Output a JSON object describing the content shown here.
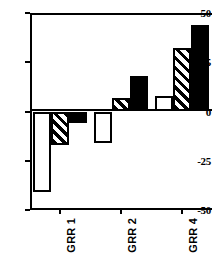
{
  "chart_data": {
    "type": "bar",
    "title": "",
    "subtitle": "",
    "xlabel": "",
    "ylabel": "",
    "categories": [
      "GRR 1",
      "GRR 2",
      "GRR 4"
    ],
    "series": [
      {
        "name": "white",
        "fill": "open",
        "values": [
          -41,
          -16,
          8
        ]
      },
      {
        "name": "hatched",
        "fill": "diagonal-hatch",
        "values": [
          -17,
          7,
          32
        ]
      },
      {
        "name": "black",
        "fill": "solid",
        "values": [
          -6,
          18,
          44
        ]
      }
    ],
    "ylim": [
      -50,
      50
    ],
    "yticks": [
      50,
      25,
      0,
      -25,
      -50
    ],
    "ytick_labels": [
      "50",
      "25",
      "0",
      "-25",
      "-50"
    ],
    "grid": false,
    "legend": "none",
    "zero_line": true,
    "colors": {
      "axis": "#000000",
      "bar_outline": "#000000",
      "bar_white": "#ffffff",
      "bar_black": "#000000",
      "background": "#ffffff"
    }
  }
}
